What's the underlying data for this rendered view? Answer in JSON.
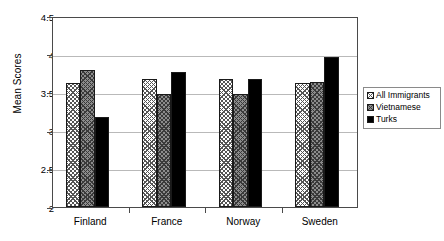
{
  "chart_data": {
    "type": "bar",
    "title": "",
    "xlabel": "",
    "ylabel": "Mean Scores",
    "ylim": [
      2,
      4.5
    ],
    "yticks": [
      "2",
      "2.5",
      "3",
      "3.5",
      "4",
      "4.5"
    ],
    "ytick_values": [
      2,
      2.5,
      3,
      3.5,
      4,
      4.5
    ],
    "grid": true,
    "legend_position": "right",
    "categories": [
      "Finland",
      "France",
      "Norway",
      "Sweden"
    ],
    "series": [
      {
        "name": "All Immigrants",
        "values": [
          3.62,
          3.68,
          3.67,
          3.62
        ],
        "color": "#ffffff",
        "pattern": "checkered-light"
      },
      {
        "name": "Vietnamese",
        "values": [
          3.79,
          3.48,
          3.48,
          3.63
        ],
        "color": "#8c8c8c",
        "pattern": "checkered-gray"
      },
      {
        "name": "Turks",
        "values": [
          3.18,
          3.77,
          3.67,
          3.97
        ],
        "color": "#000000",
        "pattern": "solid"
      }
    ]
  },
  "legend": {
    "items": [
      {
        "label": "All Immigrants"
      },
      {
        "label": "Vietnamese"
      },
      {
        "label": "Turks"
      }
    ]
  }
}
